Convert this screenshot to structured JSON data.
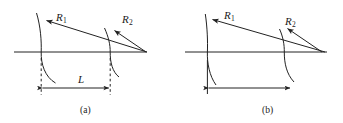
{
  "figure": {
    "type": "optics-lens-radii-diagram",
    "background": "#ffffff",
    "stroke_color": "#222222",
    "width": 343,
    "height": 123,
    "panels": [
      {
        "id": "a",
        "caption": "(a)",
        "caption_x": 80,
        "caption_y": 106,
        "axis": {
          "x1": 14,
          "y1": 52,
          "x2": 147,
          "y2": 52
        },
        "labels": [
          {
            "name": "R1",
            "base": "R",
            "sub": "1",
            "x": 56,
            "y": 12
          },
          {
            "name": "R2",
            "base": "R",
            "sub": "2",
            "x": 122,
            "y": 14
          },
          {
            "name": "L",
            "base": "L",
            "sub": "",
            "x": 78,
            "y": 74
          }
        ],
        "surfaces": [
          {
            "name": "surface-1",
            "vertex_x": 41,
            "vertex_y": 52
          },
          {
            "name": "surface-2",
            "vertex_x": 110,
            "vertex_y": 52
          }
        ],
        "radius_rays": [
          {
            "name": "R1-ray",
            "from_x": 147,
            "from_y": 52,
            "to_x": 45,
            "to_y": 20
          },
          {
            "name": "R2-ray",
            "from_x": 147,
            "from_y": 52,
            "to_x": 114,
            "to_y": 30
          }
        ],
        "dimension": {
          "name": "L-dimension",
          "y": 88,
          "x1": 41,
          "x2": 110,
          "extension_lines": "dashed",
          "label": "L"
        }
      },
      {
        "id": "b",
        "caption": "(b)",
        "caption_x": 262,
        "caption_y": 106,
        "axis": {
          "x1": 185,
          "y1": 52,
          "x2": 327,
          "y2": 52
        },
        "labels": [
          {
            "name": "R1",
            "base": "R",
            "sub": "1",
            "x": 224,
            "y": 10
          },
          {
            "name": "R2",
            "base": "R",
            "sub": "2",
            "x": 285,
            "y": 16
          }
        ],
        "surfaces": [
          {
            "name": "surface-1",
            "vertex_x": 207,
            "vertex_y": 52
          },
          {
            "name": "surface-2",
            "vertex_x": 284,
            "vertex_y": 52
          }
        ],
        "radius_rays": [
          {
            "name": "R1-ray",
            "from_x": 325,
            "from_y": 52,
            "to_x": 211,
            "to_y": 19
          },
          {
            "name": "R2-ray",
            "from_x": 322,
            "from_y": 52,
            "to_x": 287,
            "to_y": 28
          }
        ],
        "dimension": {
          "name": "length-dimension",
          "y": 88,
          "x1": 207,
          "x2": 292,
          "extension_lines": "solid",
          "label": ""
        }
      }
    ]
  }
}
